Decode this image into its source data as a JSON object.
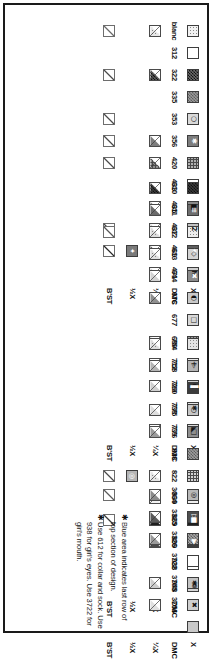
{
  "document": {
    "type": "cross-stitch-color-key",
    "orientation": "rotated-90",
    "row_labels": {
      "x": "X",
      "dmc": "DMC",
      "quarter": "¼X",
      "half": "½X",
      "backstitch": "B'ST"
    }
  },
  "sections": [
    {
      "id": "section-1",
      "entries": [
        {
          "dmc": "blanc",
          "symbol": "",
          "sw_bg": "#f2f2f2",
          "sw_fg": "#303030",
          "pattern": "dots-light",
          "quarter": true,
          "q_color": "#e6e6e6",
          "q_pattern": "dots-light",
          "half": false,
          "backstitch": true,
          "bs_color": "#6a6a6a"
        },
        {
          "dmc": "312",
          "symbol": "",
          "sw_bg": "#ffffff",
          "sw_fg": "#111111",
          "pattern": "none",
          "quarter": false,
          "q_color": "#ffffff",
          "q_pattern": "none",
          "half": false,
          "backstitch": false,
          "bs_color": "#555555"
        },
        {
          "dmc": "322",
          "symbol": "",
          "sw_bg": "#6a6a6a",
          "sw_fg": "#ffffff",
          "pattern": "checker-dark",
          "quarter": true,
          "q_color": "#5d5d5d",
          "q_pattern": "checker-dark",
          "half": false,
          "backstitch": true,
          "bs_color": "#4a4a4a"
        },
        {
          "dmc": "335",
          "symbol": "",
          "sw_bg": "#9a9a9a",
          "sw_fg": "#ffffff",
          "pattern": "checker-mid",
          "quarter": false,
          "q_color": "#9a9a9a",
          "q_pattern": "none",
          "half": false,
          "backstitch": false,
          "bs_color": "#555555"
        },
        {
          "dmc": "353",
          "symbol": "○",
          "sw_bg": "#d9d9d9",
          "sw_fg": "#1a1a1a",
          "pattern": "none",
          "quarter": false,
          "q_color": "#d9d9d9",
          "q_pattern": "none",
          "half": false,
          "backstitch": true,
          "bs_color": "#4a4a4a"
        },
        {
          "dmc": "356",
          "symbol": "✱",
          "sw_bg": "#7d7d7d",
          "sw_fg": "#ffffff",
          "pattern": "none",
          "quarter": true,
          "q_color": "#7d7d7d",
          "q_pattern": "none",
          "half": false,
          "backstitch": true,
          "bs_color": "#4a4a4a"
        },
        {
          "dmc": "420",
          "symbol": "",
          "sw_bg": "#b0b0b0",
          "sw_fg": "#1a1a1a",
          "pattern": "dots-mid",
          "quarter": true,
          "q_color": "#8e8e8e",
          "q_pattern": "dots-mid",
          "half": false,
          "backstitch": true,
          "bs_color": "#4a4a4a"
        },
        {
          "dmc": "433",
          "symbol": "",
          "sw_bg": "#ffffff",
          "sw_fg": "#111111",
          "pattern": "none",
          "quarter": false,
          "q_color": "#ffffff",
          "q_pattern": "none",
          "half": false,
          "backstitch": false,
          "bs_color": "#555555"
        },
        {
          "dmc": "435",
          "symbol": "■",
          "sw_bg": "#8a8a8a",
          "sw_fg": "#111111",
          "pattern": "none",
          "quarter": true,
          "q_color": "#8a8a8a",
          "q_pattern": "none",
          "half": false,
          "backstitch": false,
          "bs_color": "#555555"
        },
        {
          "dmc": "437",
          "symbol": "2",
          "sw_bg": "#c2c2c2",
          "sw_fg": "#1a1a1a",
          "pattern": "none",
          "quarter": true,
          "q_color": "#c8c8c8",
          "q_pattern": "none",
          "half": false,
          "backstitch": true,
          "bs_color": "#4a4a4a"
        },
        {
          "dmc": "469",
          "symbol": "✦",
          "sw_bg": "#5e5e5e",
          "sw_fg": "#ffffff",
          "pattern": "none",
          "quarter": true,
          "q_color": "#4e4e4e",
          "q_pattern": "none",
          "half": true,
          "h_bg": "#7a7a7a",
          "h_sym": "✦",
          "backstitch": true,
          "bs_color": "#2a2a2a"
        },
        {
          "dmc": "471",
          "symbol": "N",
          "sw_bg": "#cfcfcf",
          "sw_fg": "#1a1a1a",
          "pattern": "none",
          "quarter": true,
          "q_color": "#d5d5d5",
          "q_pattern": "none",
          "half": false,
          "backstitch": false,
          "bs_color": "#555555"
        }
      ]
    },
    {
      "id": "section-2",
      "entries": [
        {
          "dmc": "610",
          "symbol": "",
          "sw_bg": "#3a3a3a",
          "sw_fg": "#ffffff",
          "pattern": "checker-dark",
          "quarter": true,
          "q_color": "#3a3a3a",
          "q_pattern": "checker-dark",
          "half": false,
          "backstitch": false,
          "bs_color": "#555555"
        },
        {
          "dmc": "611",
          "symbol": "≡",
          "sw_bg": "#6e6e6e",
          "sw_fg": "#ffffff",
          "pattern": "none",
          "quarter": true,
          "q_color": "#6a6a6a",
          "q_pattern": "none",
          "half": false,
          "backstitch": false,
          "bs_color": "#555555"
        },
        {
          "dmc": "612",
          "symbol": "",
          "sw_bg": "#ededed",
          "sw_fg": "#2a2a2a",
          "pattern": "dots-light",
          "quarter": true,
          "q_color": "#dcdcdc",
          "q_pattern": "dots-light",
          "half": false,
          "backstitch": true,
          "bs_color": "#555555"
        },
        {
          "dmc": "613",
          "symbol": "◇",
          "sw_bg": "#d4d4d4",
          "sw_fg": "#1a1a1a",
          "pattern": "none",
          "quarter": true,
          "q_color": "#e0e0e0",
          "q_pattern": "dots-light",
          "half": false,
          "backstitch": false,
          "bs_color": "#555555"
        },
        {
          "dmc": "644",
          "symbol": "✖",
          "sw_bg": "#8b8b8b",
          "sw_fg": "#ffffff",
          "pattern": "none",
          "quarter": true,
          "q_color": "#d2d2d2",
          "q_pattern": "none",
          "half": false,
          "backstitch": false,
          "bs_color": "#555555"
        },
        {
          "dmc": "676",
          "symbol": "◐",
          "sw_bg": "#c9c9c9",
          "sw_fg": "#111111",
          "pattern": "none",
          "quarter": true,
          "q_color": "#8f8f8f",
          "q_pattern": "none",
          "half": false,
          "backstitch": false,
          "bs_color": "#555555"
        },
        {
          "dmc": "677",
          "symbol": "□",
          "sw_bg": "#d8d8d8",
          "sw_fg": "#1a1a1a",
          "pattern": "none",
          "quarter": false,
          "q_color": "#d8d8d8",
          "q_pattern": "none",
          "half": false,
          "backstitch": false,
          "bs_color": "#555555"
        },
        {
          "dmc": "680",
          "symbol": "",
          "sw_bg": "#9c9c9c",
          "sw_fg": "#1a1a1a",
          "pattern": "dots-mid",
          "quarter": true,
          "q_color": "#9c9c9c",
          "q_pattern": "none",
          "half": false,
          "backstitch": false,
          "bs_color": "#555555"
        },
        {
          "dmc": "712",
          "symbol": "+",
          "sw_bg": "#e8e8e8",
          "sw_fg": "#1a1a1a",
          "pattern": "none",
          "quarter": true,
          "q_color": "#f2f2f2",
          "q_pattern": "none",
          "half": false,
          "backstitch": false,
          "bs_color": "#555555"
        },
        {
          "dmc": "729",
          "symbol": "C",
          "sw_bg": "#d0d0d0",
          "sw_fg": "#1a1a1a",
          "pattern": "none",
          "quarter": true,
          "q_color": "#cfcfcf",
          "q_pattern": "none",
          "half": false,
          "backstitch": false,
          "bs_color": "#555555"
        },
        {
          "dmc": "738",
          "symbol": "✱",
          "sw_bg": "#e2e2e2",
          "sw_fg": "#1a1a1a",
          "pattern": "none",
          "quarter": false,
          "q_color": "#e2e2e2",
          "q_pattern": "none",
          "half": false,
          "backstitch": false,
          "bs_color": "#555555"
        },
        {
          "dmc": "739",
          "symbol": "◣",
          "sw_bg": "#dadada",
          "sw_fg": "#1a1a1a",
          "pattern": "none",
          "quarter": true,
          "q_color": "#f4f4f4",
          "q_pattern": "none",
          "half": false,
          "backstitch": false,
          "bs_color": "#555555"
        }
      ]
    },
    {
      "id": "section-3",
      "entries": [
        {
          "dmc": "754",
          "symbol": "",
          "sw_bg": "#e4e4e4",
          "sw_fg": "#1a1a1a",
          "pattern": "dots-light",
          "quarter": true,
          "q_color": "#dcdcdc",
          "q_pattern": "dots-light",
          "half": false,
          "backstitch": false,
          "bs_color": "#555555"
        },
        {
          "dmc": "758",
          "symbol": "▷",
          "sw_bg": "#b4b4b4",
          "sw_fg": "#1a1a1a",
          "pattern": "none",
          "quarter": true,
          "q_color": "#b4b4b4",
          "q_pattern": "none",
          "half": false,
          "backstitch": false,
          "bs_color": "#555555"
        },
        {
          "dmc": "760",
          "symbol": "▌",
          "sw_bg": "#3c3c3c",
          "sw_fg": "#ffffff",
          "pattern": "none",
          "quarter": false,
          "q_color": "#3c3c3c",
          "q_pattern": "none",
          "half": false,
          "backstitch": false,
          "bs_color": "#555555"
        },
        {
          "dmc": "775",
          "symbol": "○",
          "sw_bg": "#c6c6c6",
          "sw_fg": "#111111",
          "pattern": "none",
          "quarter": true,
          "q_color": "#dedede",
          "q_pattern": "none",
          "half": false,
          "backstitch": false,
          "bs_color": "#555555"
        },
        {
          "dmc": "776",
          "symbol": "□",
          "sw_bg": "#8f8f8f",
          "sw_fg": "#111111",
          "pattern": "none",
          "quarter": true,
          "q_color": "#9a9a9a",
          "q_pattern": "none",
          "half": false,
          "backstitch": false,
          "bs_color": "#555555"
        },
        {
          "dmc": "818",
          "symbol": "",
          "sw_bg": "#9d9d9d",
          "sw_fg": "#1a1a1a",
          "pattern": "checker-mid",
          "quarter": false,
          "q_color": "#9d9d9d",
          "q_pattern": "none",
          "half": false,
          "backstitch": false,
          "bs_color": "#555555"
        },
        {
          "dmc": "822",
          "symbol": "",
          "sw_bg": "#d2d2d2",
          "sw_fg": "#1a1a1a",
          "pattern": "dots-mid",
          "quarter": true,
          "q_color": "#e4e4e4",
          "q_pattern": "dots-light",
          "half": true,
          "h_bg": "#b5b5b5",
          "h_sym": "◎",
          "backstitch": true,
          "bs_color": "#4a4a4a"
        },
        {
          "dmc": "839",
          "symbol": "",
          "sw_bg": "#efefef",
          "sw_fg": "#1a1a1a",
          "pattern": "dots-light",
          "quarter": true,
          "q_color": "#f2f2f2",
          "q_pattern": "dots-light",
          "half": false,
          "backstitch": false,
          "bs_color": "#555555"
        },
        {
          "dmc": "869",
          "symbol": "■",
          "sw_bg": "#1f1f1f",
          "sw_fg": "#ffffff",
          "pattern": "none",
          "quarter": true,
          "q_color": "#1f1f1f",
          "q_pattern": "none",
          "half": false,
          "backstitch": true,
          "bs_color": "#3a3a3a"
        },
        {
          "dmc": "899",
          "symbol": "▶",
          "sw_bg": "#3e3e3e",
          "sw_fg": "#ffffff",
          "pattern": "none",
          "quarter": true,
          "q_color": "#4a4a4a",
          "q_pattern": "none",
          "half": false,
          "backstitch": false,
          "bs_color": "#555555"
        },
        {
          "dmc": "938",
          "symbol": "",
          "sw_bg": "#ffffff",
          "sw_fg": "#111111",
          "pattern": "none",
          "quarter": false,
          "q_color": "#ffffff",
          "q_pattern": "none",
          "half": false,
          "backstitch": false,
          "bs_color": "#555555"
        },
        {
          "dmc": "948",
          "symbol": "❁",
          "sw_bg": "#d6d6d6",
          "sw_fg": "#1a1a1a",
          "pattern": "none",
          "quarter": false,
          "q_color": "#d6d6d6",
          "q_pattern": "none",
          "half": false,
          "backstitch": false,
          "bs_color": "#555555"
        }
      ]
    },
    {
      "id": "section-4",
      "entries": [
        {
          "dmc": "3064",
          "symbol": "◎",
          "sw_bg": "#b8b8b8",
          "sw_fg": "#111111",
          "pattern": "none",
          "quarter": true,
          "q_color": "#8c8c8c",
          "q_pattern": "none",
          "half": false,
          "backstitch": true,
          "bs_color": "#5a5a5a"
        },
        {
          "dmc": "3325",
          "symbol": "▷",
          "sw_bg": "#4f4f4f",
          "sw_fg": "#ffffff",
          "pattern": "none",
          "quarter": true,
          "q_color": "#5a5a5a",
          "q_pattern": "none",
          "half": false,
          "backstitch": false,
          "bs_color": "#555555"
        },
        {
          "dmc": "3326",
          "symbol": "",
          "sw_bg": "#a5a5a5",
          "sw_fg": "#1a1a1a",
          "pattern": "checker-mid",
          "quarter": true,
          "q_color": "#9a9a9a",
          "q_pattern": "none",
          "half": false,
          "backstitch": false,
          "bs_color": "#555555"
        },
        {
          "dmc": "3722",
          "symbol": "",
          "sw_bg": "#ffffff",
          "sw_fg": "#111111",
          "pattern": "none",
          "quarter": false,
          "q_color": "#ffffff",
          "q_pattern": "none",
          "half": false,
          "backstitch": false,
          "bs_color": "#555555"
        },
        {
          "dmc": "3755",
          "symbol": "✱",
          "sw_bg": "#c4c4c4",
          "sw_fg": "#111111",
          "pattern": "none",
          "quarter": true,
          "q_color": "#cccccc",
          "q_pattern": "none",
          "half": false,
          "backstitch": false,
          "bs_color": "#555555"
        },
        {
          "dmc": "3756",
          "symbol": "✖",
          "sw_bg": "#cfcfcf",
          "sw_fg": "#111111",
          "pattern": "none",
          "quarter": true,
          "q_color": "#e0e0e0",
          "q_pattern": "none",
          "half": false,
          "backstitch": false,
          "bs_color": "#555555"
        },
        {
          "dmc": "",
          "symbol": "",
          "sw_bg": "#c9c9c9",
          "sw_fg": "#111111",
          "pattern": "none",
          "quarter": false,
          "q_color": "#c9c9c9",
          "q_pattern": "none",
          "half": false,
          "backstitch": false,
          "bs_color": "#555555"
        }
      ]
    }
  ],
  "notes": [
    {
      "bullet": "✱",
      "text": "Blue area indicates last row of top section of design."
    },
    {
      "bullet": "✱",
      "text": "Use 612 for collar and sock. Use 938 for girl's eyes. Use 3722 for girl's mouth."
    }
  ]
}
